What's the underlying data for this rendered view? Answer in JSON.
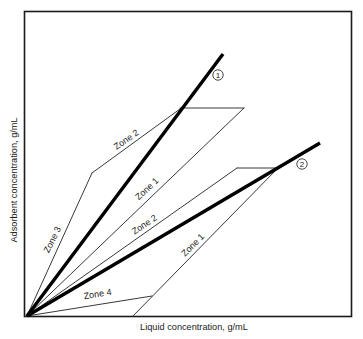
{
  "diagram": {
    "axes": {
      "x_label": "Liquid concentration, g/mL",
      "y_label": "Adsorbent concentration, g/mL"
    },
    "operating_lines": [
      {
        "id": "1",
        "marker": "1",
        "description": "Isotherm / operating line for component 1 (steeper)"
      },
      {
        "id": "2",
        "marker": "2",
        "description": "Isotherm / operating line for component 2 (shallower)"
      }
    ],
    "zone_labels": [
      {
        "id": "zone3",
        "text": "Zone 3"
      },
      {
        "id": "zone2_upper",
        "text": "Zone 2"
      },
      {
        "id": "zone1_upper",
        "text": "Zone 1"
      },
      {
        "id": "zone2_middle",
        "text": "Zone 2"
      },
      {
        "id": "zone1_lower",
        "text": "Zone 1"
      },
      {
        "id": "zone4",
        "text": "Zone 4"
      }
    ],
    "colors": {
      "line": "#000000",
      "background": "#ffffff"
    }
  }
}
